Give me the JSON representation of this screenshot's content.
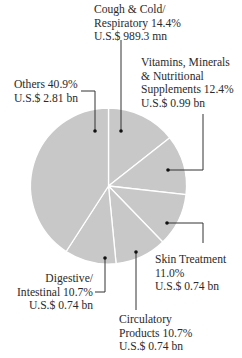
{
  "chart_data": {
    "type": "pie",
    "title": "",
    "start_angle_deg": 0,
    "direction": "clockwise",
    "slices": [
      {
        "name": "Cough & Cold/ Respiratory",
        "percent": 14.4,
        "value_text": "U.S.$ 989.3 mn"
      },
      {
        "name": "Vitamins, Minerals & Nutritional Supplements",
        "percent": 12.4,
        "value_text": "U.S.$ 0.99 bn"
      },
      {
        "name": "Skin Treatment",
        "percent": 11.0,
        "value_text": "U.S.$ 0.74 bn"
      },
      {
        "name": "Circulatory Products",
        "percent": 10.7,
        "value_text": "U.S.$ 0.74 bn"
      },
      {
        "name": "Digestive/ Intestinal",
        "percent": 10.7,
        "value_text": "U.S.$ 0.74 bn"
      },
      {
        "name": "Others",
        "percent": 40.9,
        "value_text": "U.S.$ 2.81 bn"
      }
    ],
    "colors": {
      "slice_fill": "#c8c8c8",
      "divider": "#ffffff",
      "leader": "#333333"
    }
  },
  "labels": {
    "cough": {
      "line1": "Cough & Cold/",
      "line2": "Respiratory  14.4%",
      "line3": "U.S.$ 989.3 mn"
    },
    "vitamins": {
      "line1": "Vitamins, Minerals",
      "line2": "& Nutritional",
      "line3": "Supplements 12.4%",
      "line4": "U.S.$ 0.99 bn"
    },
    "skin": {
      "line1": "Skin Treatment",
      "line2": "11.0%",
      "line3": "U.S.$ 0.74 bn"
    },
    "circulatory": {
      "line1": "Circulatory",
      "line2": "Products  10.7%",
      "line3": "U.S.$ 0.74 bn"
    },
    "digestive": {
      "line1": "Digestive/",
      "line2": "Intestinal  10.7%",
      "line3": "U.S.$ 0.74 bn"
    },
    "others": {
      "line1": "Others 40.9%",
      "line2": "U.S.$ 2.81 bn"
    }
  }
}
